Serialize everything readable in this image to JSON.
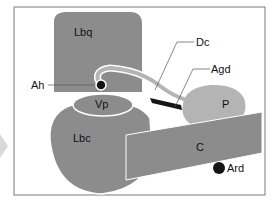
{
  "diagram": {
    "labels": {
      "lbq": "Lbq",
      "dc": "Dc",
      "agd": "Agd",
      "ah": "Ah",
      "vp": "Vp",
      "p": "P",
      "lbc": "Lbc",
      "c": "C",
      "ard": "Ard"
    },
    "colors": {
      "frame": "#7a7a7a",
      "lobe_dark": "#8c8c8c",
      "lobe_light": "#b4b4b4",
      "outline": "#ffffff",
      "black": "#151515",
      "side_arrow": "#d9d9d9"
    }
  }
}
